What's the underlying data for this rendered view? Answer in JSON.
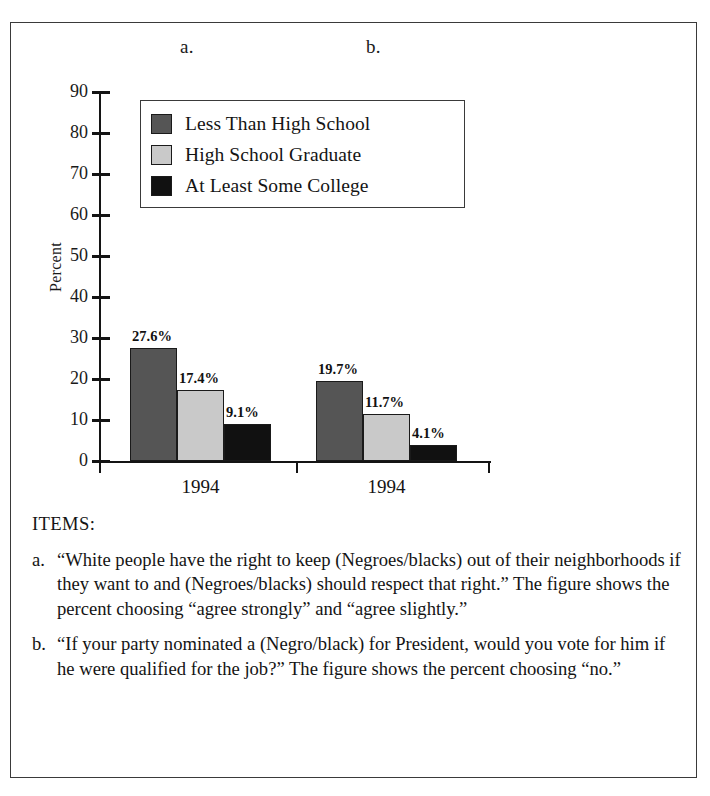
{
  "figure": {
    "panel_a_letter": "a.",
    "panel_b_letter": "b."
  },
  "chart_data": {
    "type": "bar",
    "title": "",
    "xlabel": "",
    "ylabel": "Percent",
    "ylim": [
      0,
      90
    ],
    "ytick_labels": [
      "90",
      "80",
      "70",
      "60",
      "50",
      "40",
      "30",
      "20",
      "10",
      "0"
    ],
    "yticks": [
      90,
      80,
      70,
      60,
      50,
      40,
      30,
      20,
      10,
      0
    ],
    "grid": false,
    "legend_position": "upper-center",
    "legend": [
      {
        "label": "Less Than High School",
        "color": "#555555"
      },
      {
        "label": "High School Graduate",
        "color": "#c9c9c9"
      },
      {
        "label": "At Least Some College",
        "color": "#111111"
      }
    ],
    "panels": [
      {
        "letter": "a.",
        "category": "1994",
        "bars": [
          {
            "series": "Less Than High School",
            "value": 27.6,
            "label": "27.6%",
            "color": "#555555"
          },
          {
            "series": "High School Graduate",
            "value": 17.4,
            "label": "17.4%",
            "color": "#c9c9c9"
          },
          {
            "series": "At Least Some College",
            "value": 9.1,
            "label": "9.1%",
            "color": "#111111"
          }
        ]
      },
      {
        "letter": "b.",
        "category": "1994",
        "bars": [
          {
            "series": "Less Than High School",
            "value": 19.7,
            "label": "19.7%",
            "color": "#555555"
          },
          {
            "series": "High School Graduate",
            "value": 11.7,
            "label": "11.7%",
            "color": "#c9c9c9"
          },
          {
            "series": "At Least Some College",
            "value": 4.1,
            "label": "4.1%",
            "color": "#111111"
          }
        ]
      }
    ],
    "categories": [
      "1994",
      "1994"
    ],
    "series": [
      {
        "name": "Less Than High School",
        "values": [
          27.6,
          19.7
        ]
      },
      {
        "name": "High School Graduate",
        "values": [
          17.4,
          11.7
        ]
      },
      {
        "name": "At Least Some College",
        "values": [
          9.1,
          4.1
        ]
      }
    ]
  },
  "items": {
    "heading": "ITEMS:",
    "entries": [
      {
        "marker": "a.",
        "text": "“White people have the right to keep (Negroes/blacks) out of their neighborhoods if they want to and (Negroes/blacks) should respect that right.” The figure shows the percent choosing “agree strongly” and “agree slightly.”"
      },
      {
        "marker": "b.",
        "text": "“If your party nominated a (Negro/black) for President, would you vote for him if he were qualified for the job?” The figure shows the percent choosing “no.”"
      }
    ]
  }
}
